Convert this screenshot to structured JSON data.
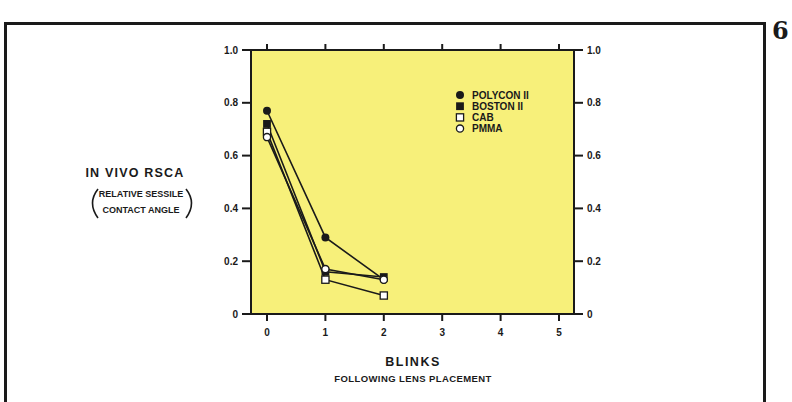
{
  "page": {
    "page_number": "6"
  },
  "colors": {
    "plot_background": "#f7f07a",
    "ink": "#1a1a1a",
    "page_background": "#ffffff"
  },
  "chart_data": {
    "type": "line",
    "title": "",
    "xlabel": "BLINKS",
    "xlabel_sub": "FOLLOWING LENS PLACEMENT",
    "ylabel": "IN VIVO RSCA",
    "ylabel_sub_line1": "RELATIVE SESSILE",
    "ylabel_sub_line2": "CONTACT ANGLE",
    "x": [
      0,
      1,
      2
    ],
    "x_ticks": [
      "0",
      "1",
      "2",
      "3",
      "4",
      "5"
    ],
    "y_ticks": [
      "0",
      "0.2",
      "0.4",
      "0.6",
      "0.8",
      "1.0"
    ],
    "xlim": [
      0,
      5
    ],
    "ylim": [
      0,
      1.0
    ],
    "grid": false,
    "legend_position": "upper right inside plot",
    "right_axis_mirrors_left": true,
    "series": [
      {
        "name": "POLYCON II",
        "marker": "filled-circle",
        "values": [
          0.77,
          0.29,
          0.13
        ]
      },
      {
        "name": "BOSTON II",
        "marker": "filled-square",
        "values": [
          0.72,
          0.16,
          0.14
        ]
      },
      {
        "name": "CAB",
        "marker": "open-square",
        "values": [
          0.69,
          0.13,
          0.07
        ]
      },
      {
        "name": "PMMA",
        "marker": "open-circle",
        "values": [
          0.67,
          0.17,
          0.13
        ]
      }
    ]
  }
}
